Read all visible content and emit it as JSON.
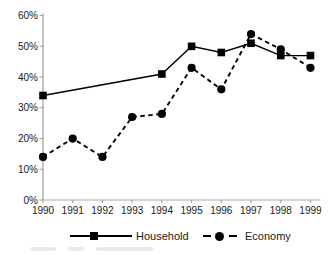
{
  "chart_data": {
    "type": "line",
    "title": "",
    "xlabel": "",
    "ylabel": "",
    "categories": [
      "1990",
      "1991",
      "1992",
      "1993",
      "1994",
      "1995",
      "1996",
      "1997",
      "1998",
      "1999"
    ],
    "series": [
      {
        "name": "Household",
        "line_style": "solid",
        "marker": "square",
        "color": "#000000",
        "values": [
          34,
          null,
          null,
          null,
          41,
          50,
          48,
          51,
          47,
          47
        ]
      },
      {
        "name": "Economy",
        "line_style": "dashed",
        "marker": "circle",
        "color": "#000000",
        "values": [
          14,
          20,
          14,
          27,
          28,
          43,
          36,
          54,
          49,
          43
        ]
      }
    ],
    "ylim": [
      0,
      60
    ],
    "ytick_step": 10,
    "ytick_labels": [
      "0%",
      "10%",
      "20%",
      "30%",
      "40%",
      "50%",
      "60%"
    ],
    "grid": false,
    "legend_position": "bottom"
  },
  "colors": {
    "series_line": "#000000",
    "y_axis": "#8c8c8c",
    "x_axis": "#a9a9a9",
    "tick": "#9a9a9a",
    "label_text": "#1a1a1a",
    "background": "#ffffff"
  }
}
